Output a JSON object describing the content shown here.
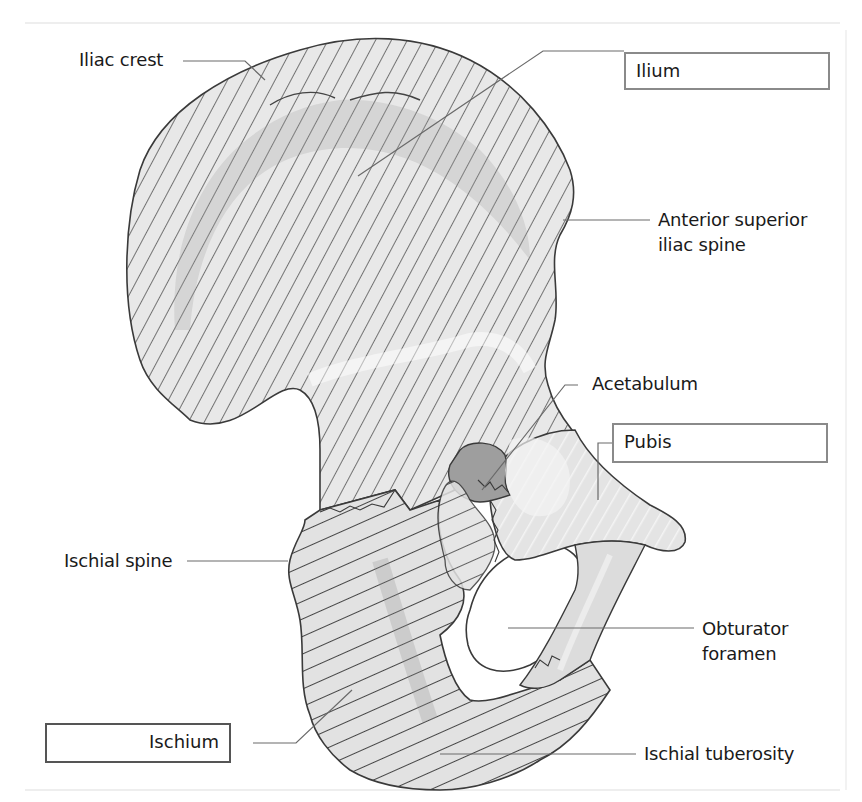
{
  "figure": {
    "colors": {
      "outline": "#3a3a3a",
      "hatch": "#555555",
      "fill_light": "#e6e6e6",
      "fill_mid": "#cfcfcf",
      "fill_dark": "#a8a8a8",
      "leader": "#6a6a6a",
      "box_border": "#8a8a8a"
    },
    "boxed_labels": {
      "ilium": "Ilium",
      "pubis": "Pubis",
      "ischium": "Ischium"
    },
    "labels": {
      "iliac_crest": "Iliac crest",
      "asis_line1": "Anterior superior",
      "asis_line2": "iliac spine",
      "acetabulum": "Acetabulum",
      "ischial_spine": "Ischial spine",
      "obturator_line1": "Obturator",
      "obturator_line2": "foramen",
      "ischial_tuberosity": "Ischial tuberosity"
    }
  }
}
